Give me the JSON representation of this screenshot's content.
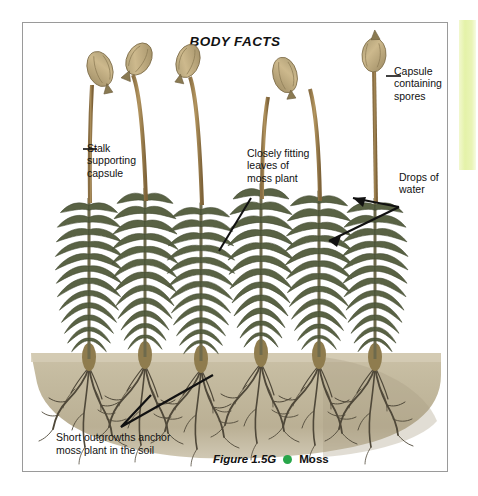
{
  "page": {
    "background_color": "#ffffff",
    "width": 478,
    "height": 496
  },
  "marker_strip": {
    "name": "highlight-strip",
    "color": "#e4f2a8"
  },
  "figure": {
    "frame_border_color": "#9a9a9a",
    "title": "BODY FACTS",
    "caption": {
      "figure_number": "Figure 1.5G",
      "dot_color": "#28a64a",
      "subject": "Moss"
    },
    "annotations": [
      {
        "id": "capsule-containing-spores",
        "text": "Capsule\ncontaining\nspores",
        "leader": "dash"
      },
      {
        "id": "stalk-supporting-capsule",
        "text": "Stalk\nsupporting\ncapsule",
        "leader": "dash"
      },
      {
        "id": "closely-fitting-leaves",
        "text": "Closely fitting\nleaves of\nmoss plant",
        "leader": "line"
      },
      {
        "id": "drops-of-water",
        "text": "Drops of\nwater",
        "leader": "double-arrow"
      },
      {
        "id": "short-outgrowths-anchor",
        "text": "Short outgrowths anchor\nmoss plant in the soil",
        "leader": "v-line"
      }
    ],
    "illustration": {
      "subject": "moss plants",
      "soil_color": "#c2b89e",
      "leaf_color": "#5a6347",
      "stalk_color": "#a38352",
      "capsule_color": "#c4a878",
      "root_color": "#4a4438",
      "plant_count": 6,
      "capsule_count": 5
    }
  }
}
